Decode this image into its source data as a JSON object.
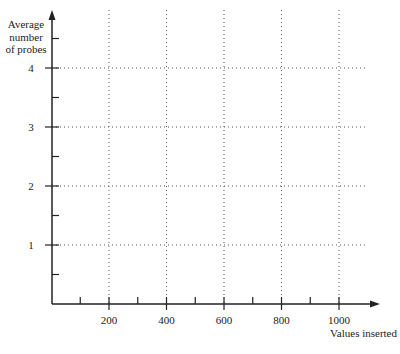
{
  "chart_data": {
    "type": "line",
    "title": "",
    "xlabel": "Values inserted",
    "ylabel": "Average number of probes",
    "ylabel_lines": [
      "Average",
      "number",
      "of probes"
    ],
    "x_ticks": [
      200,
      400,
      600,
      800,
      1000
    ],
    "x_tick_labels": [
      "200",
      "400",
      "600",
      "800",
      "1000"
    ],
    "y_ticks": [
      1,
      2,
      3,
      4
    ],
    "y_tick_labels": [
      "1",
      "2",
      "3",
      "4"
    ],
    "xlim": [
      0,
      1100
    ],
    "ylim": [
      0,
      5
    ],
    "x_minor_step": 100,
    "y_minor_step": 0.5,
    "grid": true,
    "grid_style": "dotted",
    "series": [],
    "legend": null
  },
  "colors": {
    "axis": "#222222",
    "grid": "#555555",
    "background": "#ffffff"
  }
}
